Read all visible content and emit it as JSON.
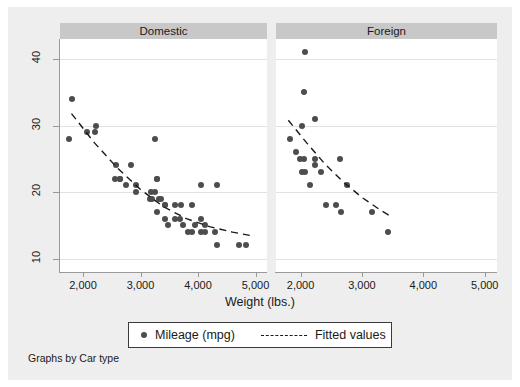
{
  "figure": {
    "note": "Graphs by Car type",
    "background": "#eeeeee",
    "panel_header_color": "#c8c8c8",
    "marker_color": "#4d4d4d"
  },
  "legend": {
    "entries": [
      {
        "label": "Mileage (mpg)",
        "type": "marker"
      },
      {
        "label": "Fitted values",
        "type": "dashed-line"
      }
    ]
  },
  "chart_data": {
    "type": "scatter",
    "title": "",
    "subtitle": "",
    "xlabel": "Weight (lbs.)",
    "ylabel": "",
    "xlim": [
      1600,
      5200
    ],
    "ylim": [
      8,
      43
    ],
    "xticks": [
      2000,
      3000,
      4000,
      5000
    ],
    "xtick_labels": [
      "2,000",
      "3,000",
      "4,000",
      "5,000"
    ],
    "yticks": [
      10,
      20,
      30,
      40
    ],
    "ytick_labels": [
      "10",
      "20",
      "30",
      "40"
    ],
    "grid": "horizontal",
    "legend_position": "bottom-center",
    "panels": [
      {
        "name": "Domestic",
        "points": [
          {
            "x": 1800,
            "y": 34
          },
          {
            "x": 1760,
            "y": 28
          },
          {
            "x": 2230,
            "y": 30
          },
          {
            "x": 2200,
            "y": 29
          },
          {
            "x": 2070,
            "y": 29
          },
          {
            "x": 2580,
            "y": 24
          },
          {
            "x": 2560,
            "y": 22
          },
          {
            "x": 2830,
            "y": 24
          },
          {
            "x": 2650,
            "y": 22
          },
          {
            "x": 2640,
            "y": 22
          },
          {
            "x": 2750,
            "y": 21
          },
          {
            "x": 2930,
            "y": 20
          },
          {
            "x": 3250,
            "y": 28
          },
          {
            "x": 3280,
            "y": 22
          },
          {
            "x": 3280,
            "y": 22
          },
          {
            "x": 3170,
            "y": 19
          },
          {
            "x": 3200,
            "y": 19
          },
          {
            "x": 3330,
            "y": 19
          },
          {
            "x": 3350,
            "y": 19
          },
          {
            "x": 3430,
            "y": 18
          },
          {
            "x": 3600,
            "y": 18
          },
          {
            "x": 3700,
            "y": 18
          },
          {
            "x": 3280,
            "y": 17
          },
          {
            "x": 3420,
            "y": 18
          },
          {
            "x": 3600,
            "y": 16
          },
          {
            "x": 3690,
            "y": 16
          },
          {
            "x": 3900,
            "y": 18
          },
          {
            "x": 4060,
            "y": 21
          },
          {
            "x": 4330,
            "y": 21
          },
          {
            "x": 3740,
            "y": 15
          },
          {
            "x": 3830,
            "y": 14
          },
          {
            "x": 3900,
            "y": 14
          },
          {
            "x": 4050,
            "y": 14
          },
          {
            "x": 4130,
            "y": 14
          },
          {
            "x": 4060,
            "y": 16
          },
          {
            "x": 4130,
            "y": 15
          },
          {
            "x": 4290,
            "y": 14
          },
          {
            "x": 3470,
            "y": 15
          },
          {
            "x": 4840,
            "y": 12
          },
          {
            "x": 4720,
            "y": 12
          },
          {
            "x": 3420,
            "y": 16
          },
          {
            "x": 3260,
            "y": 20
          },
          {
            "x": 3180,
            "y": 20
          },
          {
            "x": 2930,
            "y": 21
          },
          {
            "x": 4330,
            "y": 12
          },
          {
            "x": 3955,
            "y": 15
          }
        ],
        "fitted_curve": [
          {
            "x": 1800,
            "y": 31.8
          },
          {
            "x": 2200,
            "y": 27.4
          },
          {
            "x": 2600,
            "y": 23.6
          },
          {
            "x": 3000,
            "y": 20.4
          },
          {
            "x": 3400,
            "y": 17.8
          },
          {
            "x": 3800,
            "y": 16.0
          },
          {
            "x": 4200,
            "y": 14.8
          },
          {
            "x": 4600,
            "y": 14.0
          },
          {
            "x": 4900,
            "y": 13.5
          }
        ]
      },
      {
        "name": "Foreign",
        "points": [
          {
            "x": 2070,
            "y": 41
          },
          {
            "x": 2050,
            "y": 35
          },
          {
            "x": 2230,
            "y": 31
          },
          {
            "x": 2020,
            "y": 30
          },
          {
            "x": 1830,
            "y": 28
          },
          {
            "x": 1930,
            "y": 26
          },
          {
            "x": 1990,
            "y": 25
          },
          {
            "x": 2050,
            "y": 25
          },
          {
            "x": 2240,
            "y": 25
          },
          {
            "x": 2650,
            "y": 25
          },
          {
            "x": 2240,
            "y": 24
          },
          {
            "x": 2020,
            "y": 23
          },
          {
            "x": 2070,
            "y": 23
          },
          {
            "x": 2330,
            "y": 23
          },
          {
            "x": 2160,
            "y": 21
          },
          {
            "x": 2750,
            "y": 21
          },
          {
            "x": 2410,
            "y": 18
          },
          {
            "x": 2570,
            "y": 18
          },
          {
            "x": 2660,
            "y": 17
          },
          {
            "x": 3170,
            "y": 17
          },
          {
            "x": 3420,
            "y": 14
          }
        ],
        "fitted_curve": [
          {
            "x": 1800,
            "y": 30.8
          },
          {
            "x": 2100,
            "y": 27.4
          },
          {
            "x": 2400,
            "y": 24.2
          },
          {
            "x": 2700,
            "y": 21.5
          },
          {
            "x": 3000,
            "y": 19.2
          },
          {
            "x": 3300,
            "y": 17.3
          },
          {
            "x": 3500,
            "y": 16.2
          }
        ]
      }
    ]
  }
}
